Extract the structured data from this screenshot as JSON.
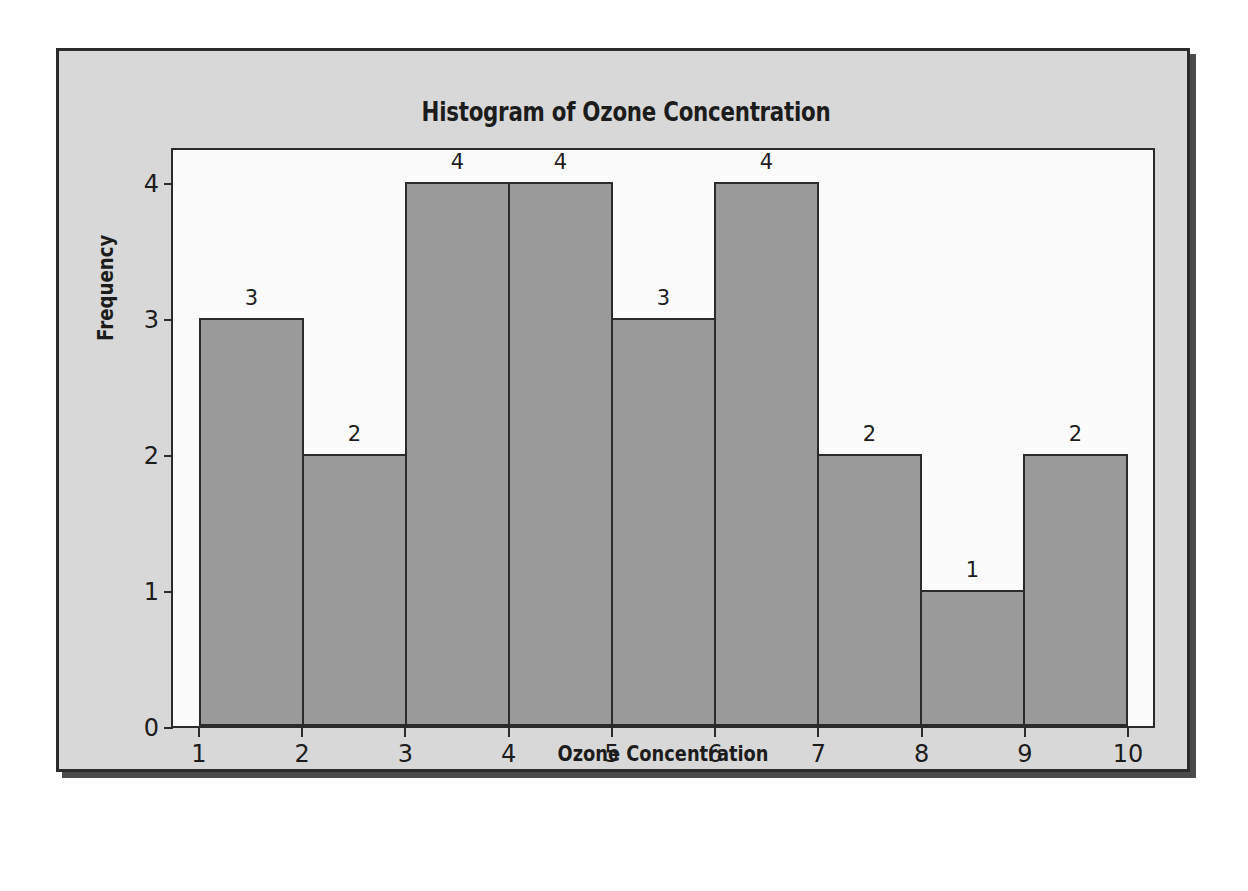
{
  "chart_data": {
    "type": "bar",
    "title": "Histogram of Ozone Concentration",
    "xlabel": "Ozone Concentration",
    "ylabel": "Frequency",
    "categories": [
      "1-2",
      "2-3",
      "3-4",
      "4-5",
      "5-6",
      "6-7",
      "7-8",
      "8-9",
      "9-10"
    ],
    "values": [
      3,
      2,
      4,
      4,
      3,
      4,
      2,
      1,
      2
    ],
    "bar_labels": [
      "3",
      "2",
      "4",
      "4",
      "3",
      "4",
      "2",
      "1",
      "2"
    ],
    "bin_edges": [
      1,
      2,
      3,
      4,
      5,
      6,
      7,
      8,
      9,
      10
    ],
    "xticks": [
      "1",
      "2",
      "3",
      "4",
      "5",
      "6",
      "7",
      "8",
      "9",
      "10"
    ],
    "yticks": [
      "0",
      "1",
      "2",
      "3",
      "4"
    ],
    "xlim": [
      0.7,
      10.6
    ],
    "ylim": [
      0,
      4.25
    ],
    "grid": false,
    "legend": null,
    "colors": {
      "bar_fill": "#9a9a9a",
      "bar_edge": "#2b2b2b",
      "figure_background": "#d8d8d8",
      "plot_background": "#fbfbfb",
      "frame_border": "#2b2b2b",
      "text": "#1c1c1c"
    }
  }
}
